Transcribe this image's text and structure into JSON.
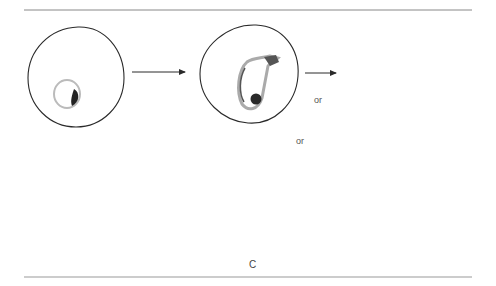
{
  "diagram": {
    "type": "life-cycle",
    "colors": {
      "outline": "#2a2a2a",
      "stipple": "#cfcfcf",
      "dark": "#262626",
      "rule": "#888888"
    },
    "labels": {
      "or_upper": "or",
      "or_lower": "or",
      "stage_c": "C"
    },
    "nodes": [
      {
        "id": "ring-cell",
        "desc": "red cell with ring form"
      },
      {
        "id": "trophozoite-cell",
        "desc": "red cell with amoeboid trophozoite"
      },
      {
        "id": "gametocyte-oval",
        "desc": "oval gametocyte form"
      },
      {
        "id": "gametocyte-crescent",
        "desc": "crescent gametocyte form"
      },
      {
        "id": "schizont-cell",
        "desc": "red cell with schizont (C)"
      },
      {
        "id": "segmenter-cell",
        "desc": "rupturing cell releasing merozoites"
      },
      {
        "id": "merozoites",
        "desc": "free merozoites"
      }
    ],
    "edges": [
      {
        "from": "ring-cell",
        "to": "trophozoite-cell"
      },
      {
        "from": "trophozoite-cell",
        "to": "gametocyte-oval",
        "label": "or"
      },
      {
        "from": "trophozoite-cell",
        "to": "gametocyte-crescent",
        "label": "or"
      },
      {
        "from": "trophozoite-cell",
        "to": "schizont-cell"
      },
      {
        "from": "schizont-cell",
        "to": "segmenter-cell"
      },
      {
        "from": "segmenter-cell",
        "to": "merozoites"
      },
      {
        "from": "segmenter-cell",
        "to": "ring-cell"
      }
    ]
  }
}
